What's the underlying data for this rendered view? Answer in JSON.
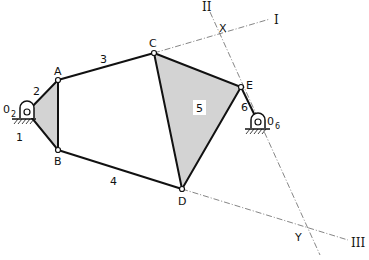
{
  "diagram": {
    "title": "",
    "joints": {
      "O2": {
        "label": "0",
        "sub": "2",
        "x": 27,
        "y": 112
      },
      "A": {
        "label": "A",
        "x": 58,
        "y": 80
      },
      "B": {
        "label": "B",
        "x": 58,
        "y": 150
      },
      "C": {
        "label": "C",
        "x": 154,
        "y": 53
      },
      "D": {
        "label": "D",
        "x": 182,
        "y": 189
      },
      "E": {
        "label": "E",
        "x": 241,
        "y": 87
      },
      "O6": {
        "label": "0",
        "sub": "6",
        "x": 258,
        "y": 122
      }
    },
    "links": {
      "l1": "1",
      "l2": "2",
      "l3": "3",
      "l4": "4",
      "l5": "5",
      "l6": "6"
    },
    "lines": {
      "I": "I",
      "II": "II",
      "III": "III"
    },
    "intersections": {
      "X": "X",
      "Y": "Y"
    },
    "colors": {
      "fill": "#d3d3d3",
      "stroke": "#111111",
      "construction": "#555555"
    }
  }
}
